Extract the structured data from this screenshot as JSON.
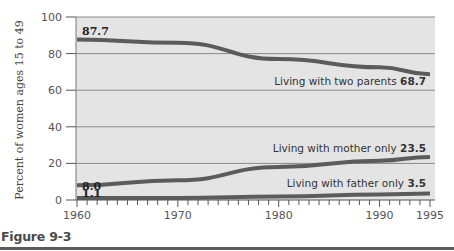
{
  "figure_label": "Figure 9-3",
  "chart_data": {
    "type": "line",
    "title": "",
    "xlabel": "",
    "ylabel": "Percent of women ages 15 to 49",
    "x": [
      1960,
      1970,
      1980,
      1990,
      1995
    ],
    "x_ticks": [
      "1960",
      "1970",
      "1980",
      "1990",
      "1995"
    ],
    "y_ticks": [
      "0",
      "20",
      "40",
      "60",
      "80",
      "100"
    ],
    "ylim": [
      0,
      100
    ],
    "xlim": [
      1960,
      1995
    ],
    "grid": true,
    "legend_position": "inline labels",
    "series": [
      {
        "name": "Living with two parents",
        "values": [
          87.7,
          85.9,
          77.0,
          72.5,
          68.7
        ],
        "start_label": "87.7",
        "end_label": "68.7"
      },
      {
        "name": "Living with mother only",
        "values": [
          8.0,
          10.8,
          18.0,
          21.5,
          23.5
        ],
        "start_label": "8.0",
        "end_label": "23.5"
      },
      {
        "name": "Living with father only",
        "values": [
          1.1,
          1.1,
          1.9,
          3.0,
          3.5
        ],
        "start_label": "1.1",
        "end_label": "3.5"
      }
    ]
  },
  "colors": {
    "plot_background": "#e4e4e4",
    "line": "#5b5b5b",
    "gridline": "#8a8a8a",
    "rule": "#5a5a5a"
  }
}
